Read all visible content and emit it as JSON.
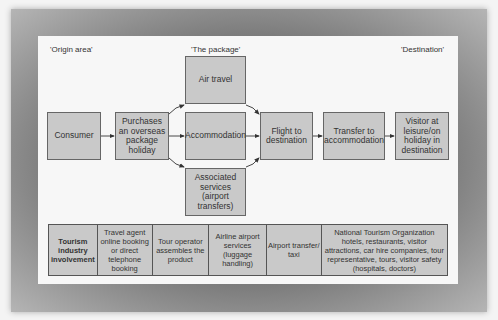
{
  "regions": {
    "origin": "'Origin area'",
    "package": "'The package'",
    "destination": "'Destination'"
  },
  "boxes": {
    "consumer": "Consumer",
    "purchases": "Purchases an overseas package holiday",
    "air_travel": "Air travel",
    "accommodation": "Accommodation",
    "associated": "Associated services (airport transfers)",
    "flight": "Flight to destination",
    "transfer": "Transfer to accommodation",
    "visitor": "Visitor at leisure/on holiday in destination"
  },
  "table": {
    "header": "Tourism industry involvement",
    "cells": [
      "Travel agent online booking or direct telephone booking",
      "Tour operator assembles the product",
      "Airline airport services (luggage handling)",
      "Airport transfer/ taxi",
      "National Tourism Organization hotels, restaurants, visitor attractions, car hire companies, tour representative, tours, visitor safety (hospitals, doctors)"
    ]
  },
  "colors": {
    "box_fill": "#c9c9c9",
    "border": "#666666",
    "panel": "#f7f7f7",
    "frame": "#666666"
  }
}
